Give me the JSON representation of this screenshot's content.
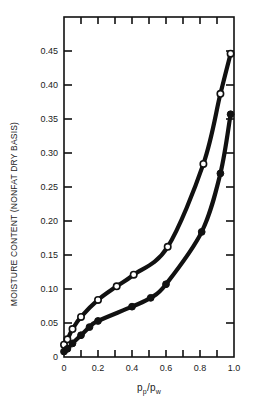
{
  "chart_data": {
    "type": "line",
    "title": "",
    "xlabel": "p_p/p_w",
    "xlabel_main": "p",
    "xlabel_sub1": "p",
    "xlabel_slash": "/p",
    "xlabel_sub2": "w",
    "ylabel": "MOISTURE CONTENT  (NONFAT DRY BASIS)",
    "xlim": [
      0,
      1.0
    ],
    "ylim": [
      0,
      0.5
    ],
    "grid": false,
    "legend": "none",
    "x_ticks": [
      0,
      0.1,
      0.2,
      0.3,
      0.4,
      0.5,
      0.6,
      0.7,
      0.8,
      0.9,
      1.0
    ],
    "x_tick_labels": [
      "0",
      "0.2",
      "0.4",
      "0.6",
      "0.8",
      "1.0"
    ],
    "x_tick_label_values": [
      0,
      0.2,
      0.4,
      0.6,
      0.8,
      1.0
    ],
    "y_ticks": [
      0,
      0.05,
      0.1,
      0.15,
      0.2,
      0.25,
      0.3,
      0.35,
      0.4,
      0.45
    ],
    "y_tick_labels": [
      "0",
      "0.05",
      "0.10",
      "0.15",
      "0.20",
      "0.25",
      "0.30",
      "0.35",
      "0.40",
      "0.45"
    ],
    "series": [
      {
        "name": "open circles (upper curve)",
        "marker": "open-circle",
        "x": [
          0.0,
          0.02,
          0.05,
          0.1,
          0.2,
          0.31,
          0.41,
          0.61,
          0.82,
          0.92,
          0.98
        ],
        "y": [
          0.018,
          0.026,
          0.041,
          0.059,
          0.084,
          0.104,
          0.121,
          0.162,
          0.284,
          0.387,
          0.446
        ]
      },
      {
        "name": "filled circles (lower curve)",
        "marker": "filled-circle",
        "x": [
          0.0,
          0.02,
          0.05,
          0.1,
          0.15,
          0.2,
          0.4,
          0.51,
          0.6,
          0.81,
          0.92,
          0.98
        ],
        "y": [
          0.008,
          0.012,
          0.02,
          0.032,
          0.044,
          0.053,
          0.074,
          0.087,
          0.107,
          0.184,
          0.27,
          0.357
        ]
      }
    ]
  },
  "colors": {
    "ink": "#111111",
    "background": "#ffffff"
  }
}
